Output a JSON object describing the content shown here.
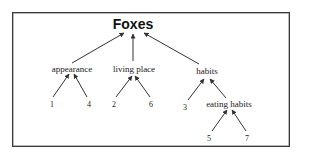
{
  "diagram": {
    "type": "tree",
    "direction": "bottom-up arrows toward parent",
    "root": {
      "id": "foxes",
      "label": "Foxes",
      "x": 133,
      "y": 24
    },
    "nodes": [
      {
        "id": "appearance",
        "label": "appearance",
        "x": 72,
        "y": 69,
        "parent": "foxes"
      },
      {
        "id": "living_place",
        "label": "living place",
        "x": 134,
        "y": 69,
        "parent": "foxes"
      },
      {
        "id": "habits",
        "label": "habits",
        "x": 207,
        "y": 71,
        "parent": "foxes"
      },
      {
        "id": "n1",
        "label": "1",
        "x": 52,
        "y": 105,
        "parent": "appearance"
      },
      {
        "id": "n4",
        "label": "4",
        "x": 89,
        "y": 105,
        "parent": "appearance"
      },
      {
        "id": "n2",
        "label": "2",
        "x": 114,
        "y": 105,
        "parent": "living_place"
      },
      {
        "id": "n6",
        "label": "6",
        "x": 151,
        "y": 105,
        "parent": "living_place"
      },
      {
        "id": "n3",
        "label": "3",
        "x": 185,
        "y": 108,
        "parent": "habits"
      },
      {
        "id": "eating_habits",
        "label": "eating habits",
        "x": 229,
        "y": 104,
        "parent": "habits"
      },
      {
        "id": "n5",
        "label": "5",
        "x": 209,
        "y": 139,
        "parent": "eating_habits"
      },
      {
        "id": "n7",
        "label": "7",
        "x": 247,
        "y": 139,
        "parent": "eating_habits"
      }
    ],
    "edges": [
      {
        "from": "appearance",
        "to": "foxes",
        "x1": 72,
        "y1": 63,
        "x2": 124,
        "y2": 33
      },
      {
        "from": "living_place",
        "to": "foxes",
        "x1": 133,
        "y1": 61,
        "x2": 133,
        "y2": 34
      },
      {
        "from": "habits",
        "to": "foxes",
        "x1": 199,
        "y1": 64,
        "x2": 144,
        "y2": 33
      },
      {
        "from": "n1",
        "to": "appearance",
        "x1": 53,
        "y1": 97,
        "x2": 69,
        "y2": 74
      },
      {
        "from": "n4",
        "to": "appearance",
        "x1": 87,
        "y1": 97,
        "x2": 74,
        "y2": 74
      },
      {
        "from": "n2",
        "to": "living_place",
        "x1": 116,
        "y1": 97,
        "x2": 132,
        "y2": 76
      },
      {
        "from": "n6",
        "to": "living_place",
        "x1": 150,
        "y1": 97,
        "x2": 135,
        "y2": 76
      },
      {
        "from": "n3",
        "to": "habits",
        "x1": 188,
        "y1": 100,
        "x2": 204,
        "y2": 79
      },
      {
        "from": "eating_habits",
        "to": "habits",
        "x1": 226,
        "y1": 98,
        "x2": 210,
        "y2": 79
      },
      {
        "from": "n5",
        "to": "eating_habits",
        "x1": 212,
        "y1": 131,
        "x2": 227,
        "y2": 110
      },
      {
        "from": "n7",
        "to": "eating_habits",
        "x1": 246,
        "y1": 131,
        "x2": 232,
        "y2": 110
      }
    ],
    "colors": {
      "line": "#333333",
      "text": "#222222",
      "border": "#3a3a3a",
      "background": "#ffffff"
    }
  }
}
